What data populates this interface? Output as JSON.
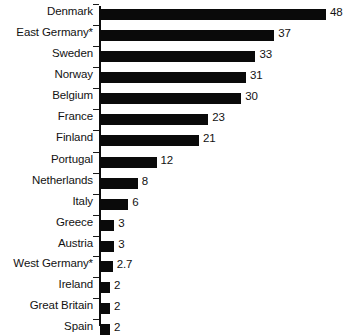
{
  "chart_data": {
    "type": "bar",
    "orientation": "horizontal",
    "title": "",
    "subtitle": "",
    "xlabel": "",
    "ylabel": "",
    "grid": false,
    "legend": null,
    "xlim": [
      0,
      48
    ],
    "categories": [
      "Denmark",
      "East Germany*",
      "Sweden",
      "Norway",
      "Belgium",
      "France",
      "Finland",
      "Portugal",
      "Netherlands",
      "Italy",
      "Greece",
      "Austria",
      "West Germany*",
      "Ireland",
      "Great Britain",
      "Spain"
    ],
    "values": [
      48,
      37,
      33,
      31,
      30,
      23,
      21,
      12,
      8,
      6,
      3,
      3,
      2.7,
      2,
      2,
      2
    ],
    "value_labels": [
      "48",
      "37",
      "33",
      "31",
      "30",
      "23",
      "21",
      "12",
      "8",
      "6",
      "3",
      "3",
      "2.7",
      "2",
      "2",
      "2"
    ],
    "bar_color": "#0a0a0a",
    "background_color": "#ffffff",
    "axis_color": "#0d0d0d"
  },
  "rows": [
    {
      "label": "Denmark",
      "value": 48,
      "value_label": "48",
      "top": 9
    },
    {
      "label": "East Germany*",
      "value": 37,
      "value_label": "37",
      "top": 30
    },
    {
      "label": "Sweden",
      "value": 33,
      "value_label": "33",
      "top": 51
    },
    {
      "label": "Norway",
      "value": 31,
      "value_label": "31",
      "top": 72
    },
    {
      "label": "Belgium",
      "value": 30,
      "value_label": "30",
      "top": 93
    },
    {
      "label": "France",
      "value": 23,
      "value_label": "23",
      "top": 114
    },
    {
      "label": "Finland",
      "value": 21,
      "value_label": "21",
      "top": 135
    },
    {
      "label": "Portugal",
      "value": 12,
      "value_label": "12",
      "top": 157
    },
    {
      "label": "Netherlands",
      "value": 8,
      "value_label": "8",
      "top": 178
    },
    {
      "label": "Italy",
      "value": 6,
      "value_label": "6",
      "top": 199
    },
    {
      "label": "Greece",
      "value": 3,
      "value_label": "3",
      "top": 220
    },
    {
      "label": "Austria",
      "value": 3,
      "value_label": "3",
      "top": 241
    },
    {
      "label": "West Germany*",
      "value": 2.7,
      "value_label": "2.7",
      "top": 261
    },
    {
      "label": "Ireland",
      "value": 2,
      "value_label": "2",
      "top": 282
    },
    {
      "label": "Great Britain",
      "value": 2,
      "value_label": "2",
      "top": 303
    },
    {
      "label": "Spain",
      "value": 2,
      "value_label": "2",
      "top": 324
    }
  ],
  "scale": {
    "px_per_unit": 4.71,
    "origin_x": 100,
    "min_bar_px": 10
  }
}
